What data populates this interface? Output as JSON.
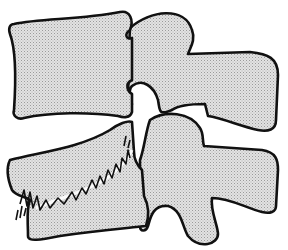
{
  "illustration": {
    "subject": "Two adjacent vertebrae in lateral view with marginal osteophytes",
    "colors": {
      "background": "#ffffff",
      "bone_fill": "#d9d9d9",
      "outline": "#111111"
    },
    "parts": [
      {
        "name": "upper-vertebral-body"
      },
      {
        "name": "upper-posterior-elements"
      },
      {
        "name": "lower-vertebral-body"
      },
      {
        "name": "lower-posterior-elements"
      },
      {
        "name": "osteophyte-spurs"
      }
    ]
  }
}
